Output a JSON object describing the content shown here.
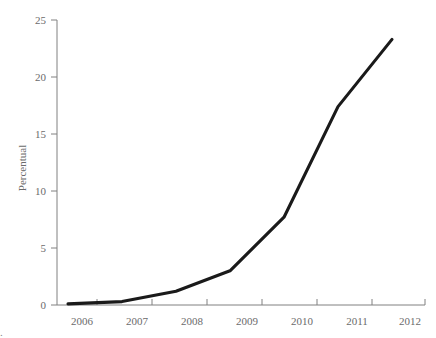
{
  "chart_data": {
    "type": "line",
    "title": "",
    "xlabel": "",
    "ylabel": "Percentual",
    "x": [
      2006,
      2007,
      2008,
      2009,
      2010,
      2011,
      2012
    ],
    "categories": [
      "2006",
      "2007",
      "2008",
      "2009",
      "2010",
      "2011",
      "2012"
    ],
    "values": [
      0.1,
      0.3,
      1.2,
      3.0,
      7.7,
      17.4,
      23.3
    ],
    "series": [
      {
        "name": "Percentual",
        "values": [
          0.1,
          0.3,
          1.2,
          3.0,
          7.7,
          17.4,
          23.3
        ]
      }
    ],
    "xlim": [
      2006,
      2012
    ],
    "ylim": [
      0,
      25
    ],
    "yticks": [
      0,
      5,
      10,
      15,
      20,
      25
    ],
    "ytick_labels": [
      "0",
      "5",
      "10",
      "15",
      "20",
      "25"
    ],
    "xticks": [
      2006,
      2007,
      2008,
      2009,
      2010,
      2011,
      2012
    ],
    "xtick_labels": [
      "2006",
      "2007",
      "2008",
      "2009",
      "2010",
      "2011",
      "2012"
    ],
    "grid": false,
    "legend": false,
    "legend_position": "none",
    "line_color": "#1a1a1a",
    "axis_color": "#808080",
    "text_color": "#6b6b6b",
    "background_color": "#ffffff"
  },
  "axes": {
    "y_title": "Percentual"
  },
  "ticks": {
    "y": [
      {
        "label": "25",
        "value": 25
      },
      {
        "label": "20",
        "value": 20
      },
      {
        "label": "15",
        "value": 15
      },
      {
        "label": "10",
        "value": 10
      },
      {
        "label": "5",
        "value": 5
      },
      {
        "label": "0",
        "value": 0
      }
    ],
    "x": [
      {
        "label": "2006",
        "value": 2006
      },
      {
        "label": "2007",
        "value": 2007
      },
      {
        "label": "2008",
        "value": 2008
      },
      {
        "label": "2009",
        "value": 2009
      },
      {
        "label": "2010",
        "value": 2010
      },
      {
        "label": "2011",
        "value": 2011
      },
      {
        "label": "2012",
        "value": 2012
      }
    ]
  },
  "caption": {
    "text": "."
  }
}
